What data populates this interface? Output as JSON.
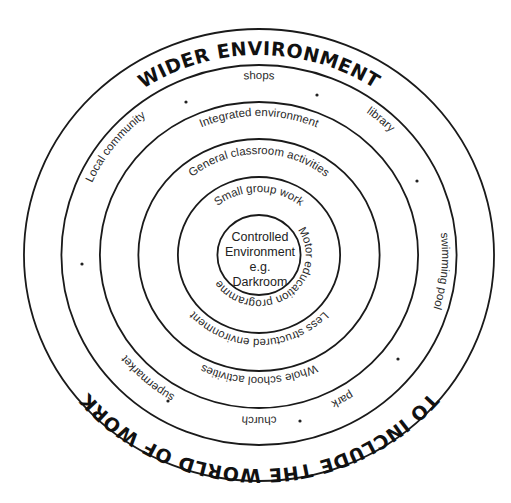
{
  "diagram": {
    "title_top": "WIDER ENVIRONMENT",
    "title_bottom": "TO INCLUDE THE WORLD OF WORK",
    "core": {
      "lines": [
        "Controlled",
        "Environment",
        "e.g.",
        "Darkroom"
      ]
    },
    "rings": [
      {
        "name": "ring-1",
        "top_label": "Small group work",
        "right_label": "Motor education programmes"
      },
      {
        "name": "ring-2",
        "top_label": "General classroom activities",
        "bottom_label": "Less structured environment"
      },
      {
        "name": "ring-3",
        "top_label": "Integrated environment",
        "bottom_label": "Whole school activities"
      },
      {
        "name": "ring-4",
        "labels": [
          "shops",
          "library",
          "swimming pool",
          "park",
          "church",
          "supermarket",
          "Local community"
        ],
        "separator_dots": 7
      }
    ],
    "colors": {
      "line": "#1a1a1a",
      "text": "#2a2a2a",
      "background": "#ffffff"
    }
  }
}
